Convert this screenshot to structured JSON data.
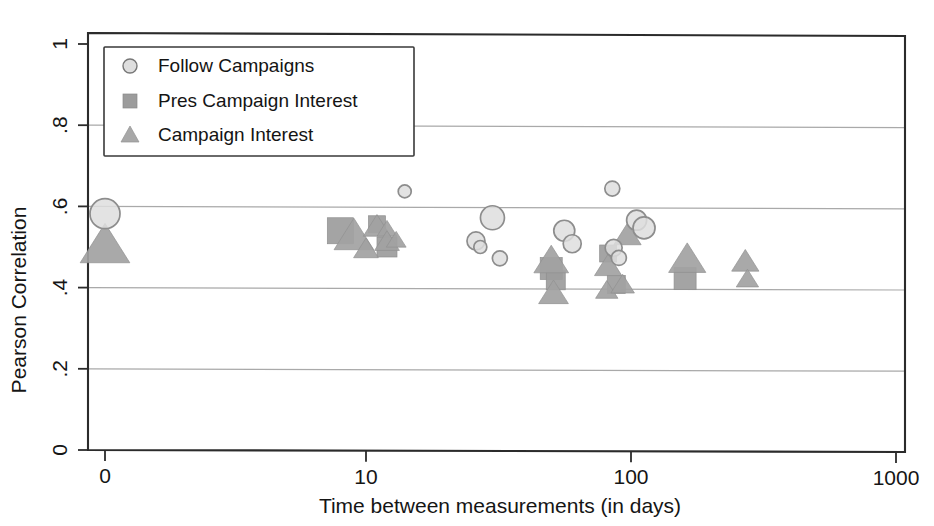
{
  "chart_data": {
    "type": "scatter",
    "title": "",
    "xlabel": "Time between measurements (in days)",
    "ylabel": "Pearson Correlation",
    "xscale": "log",
    "xticks": [
      0,
      10,
      100,
      1000
    ],
    "xtick_labels": [
      "0",
      "10",
      "100",
      "1000"
    ],
    "yticks": [
      0,
      0.2,
      0.4,
      0.6,
      0.8,
      1
    ],
    "ytick_labels": [
      "0",
      ".2",
      ".4",
      ".6",
      ".8",
      "1"
    ],
    "ylim": [
      0,
      1
    ],
    "grid": "horizontal",
    "legend_position": "top-left",
    "legend": [
      "Follow Campaigns",
      "Pres Campaign Interest",
      "Campaign Interest"
    ],
    "note": "Marker area is proportional to sample size / weight; x=0 points plotted at axis origin.",
    "series": [
      {
        "name": "Follow Campaigns",
        "marker": "circle",
        "color": "#dedede",
        "points": [
          {
            "x": 0,
            "y": 0.582,
            "size": 30
          },
          {
            "x": 14,
            "y": 0.637,
            "size": 13
          },
          {
            "x": 26,
            "y": 0.515,
            "size": 18
          },
          {
            "x": 27,
            "y": 0.5,
            "size": 13
          },
          {
            "x": 30,
            "y": 0.572,
            "size": 24
          },
          {
            "x": 32,
            "y": 0.472,
            "size": 15
          },
          {
            "x": 56,
            "y": 0.54,
            "size": 21
          },
          {
            "x": 60,
            "y": 0.508,
            "size": 18
          },
          {
            "x": 85,
            "y": 0.644,
            "size": 15
          },
          {
            "x": 86,
            "y": 0.498,
            "size": 17
          },
          {
            "x": 90,
            "y": 0.473,
            "size": 15
          },
          {
            "x": 105,
            "y": 0.566,
            "size": 20
          },
          {
            "x": 112,
            "y": 0.547,
            "size": 22
          }
        ]
      },
      {
        "name": "Pres Campaign Interest",
        "marker": "square",
        "color": "#9c9c9c",
        "points": [
          {
            "x": 8,
            "y": 0.54,
            "size": 26
          },
          {
            "x": 11,
            "y": 0.556,
            "size": 17
          },
          {
            "x": 12,
            "y": 0.5,
            "size": 20
          },
          {
            "x": 50,
            "y": 0.447,
            "size": 22
          },
          {
            "x": 52,
            "y": 0.418,
            "size": 19
          },
          {
            "x": 82,
            "y": 0.484,
            "size": 17
          },
          {
            "x": 88,
            "y": 0.408,
            "size": 18
          },
          {
            "x": 160,
            "y": 0.422,
            "size": 22
          }
        ]
      },
      {
        "name": "Campaign Interest",
        "marker": "triangle",
        "color": "#a2a2a2",
        "points": [
          {
            "x": 0,
            "y": 0.502,
            "size": 40
          },
          {
            "x": 9,
            "y": 0.526,
            "size": 32
          },
          {
            "x": 10,
            "y": 0.494,
            "size": 20
          },
          {
            "x": 11,
            "y": 0.549,
            "size": 22
          },
          {
            "x": 12,
            "y": 0.543,
            "size": 16
          },
          {
            "x": 12,
            "y": 0.512,
            "size": 20
          },
          {
            "x": 13,
            "y": 0.516,
            "size": 16
          },
          {
            "x": 50,
            "y": 0.465,
            "size": 28
          },
          {
            "x": 51,
            "y": 0.385,
            "size": 24
          },
          {
            "x": 82,
            "y": 0.452,
            "size": 22
          },
          {
            "x": 81,
            "y": 0.392,
            "size": 18
          },
          {
            "x": 93,
            "y": 0.406,
            "size": 19
          },
          {
            "x": 97,
            "y": 0.528,
            "size": 22
          },
          {
            "x": 163,
            "y": 0.468,
            "size": 30
          },
          {
            "x": 270,
            "y": 0.463,
            "size": 22
          },
          {
            "x": 275,
            "y": 0.42,
            "size": 18
          }
        ]
      }
    ]
  },
  "axes": {
    "y_title": "Pearson Correlation",
    "x_title": "Time between measurements (in days)"
  }
}
